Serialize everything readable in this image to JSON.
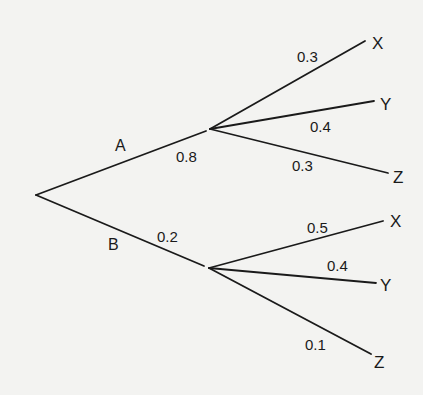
{
  "diagram": {
    "type": "probability-tree",
    "root": {
      "branches": [
        {
          "event": "A",
          "probability": "0.8",
          "children": [
            {
              "outcome": "X",
              "probability": "0.3"
            },
            {
              "outcome": "Y",
              "probability": "0.4"
            },
            {
              "outcome": "Z",
              "probability": "0.3"
            }
          ]
        },
        {
          "event": "B",
          "probability": "0.2",
          "children": [
            {
              "outcome": "X",
              "probability": "0.5"
            },
            {
              "outcome": "Y",
              "probability": "0.4"
            },
            {
              "outcome": "Z",
              "probability": "0.1"
            }
          ]
        }
      ]
    }
  },
  "colors": {
    "background": "#f3f3f1",
    "ink": "#1a1a1a"
  }
}
